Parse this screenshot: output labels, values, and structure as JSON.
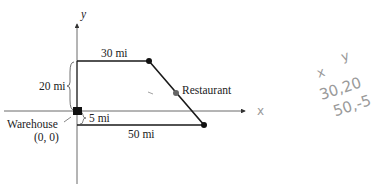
{
  "diagram": {
    "axes": {
      "x_label": "x",
      "y_label": "y"
    },
    "labels": {
      "top_segment": "30 mi",
      "vertical_segment": "20 mi",
      "small_offset": "5 mi",
      "bottom_segment": "50 mi",
      "restaurant": "Restaurant",
      "warehouse": "Warehouse",
      "warehouse_coords": "(0, 0)"
    },
    "handwritten_notes": {
      "header_x": "x",
      "header_y": "y",
      "row1": "30,20",
      "row2": "50,-5"
    },
    "colors": {
      "line": "#1a1a1a",
      "axis": "#333333",
      "restaurant_dot": "#666666",
      "pencil": "#9a9a9a"
    }
  }
}
